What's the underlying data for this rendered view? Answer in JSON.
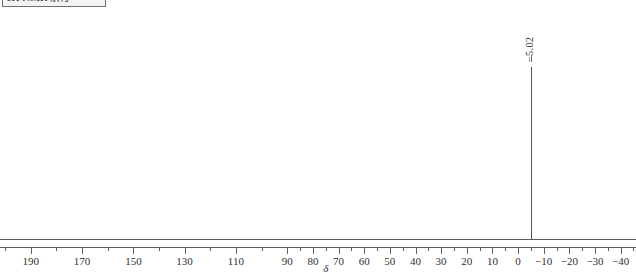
{
  "title_strip": {
    "text": "1H NMR 解序"
  },
  "chart_data": {
    "type": "line",
    "title": "",
    "subtitle": "",
    "xlabel": "δ",
    "ylabel": "",
    "grid": false,
    "legend": null,
    "xlim": [
      202,
      -46
    ],
    "x_axis_reversed": true,
    "ylim": [
      0,
      1
    ],
    "tick_labels": [
      {
        "value": 190,
        "label": "190"
      },
      {
        "value": 170,
        "label": "170"
      },
      {
        "value": 150,
        "label": "150"
      },
      {
        "value": 130,
        "label": "130"
      },
      {
        "value": 110,
        "label": "110"
      },
      {
        "value": 90,
        "label": "90"
      },
      {
        "value": 80,
        "label": "80"
      },
      {
        "value": 70,
        "label": "70"
      },
      {
        "value": 60,
        "label": "60"
      },
      {
        "value": 50,
        "label": "50"
      },
      {
        "value": 40,
        "label": "40"
      },
      {
        "value": 30,
        "label": "30"
      },
      {
        "value": 20,
        "label": "20"
      },
      {
        "value": 10,
        "label": "10"
      },
      {
        "value": 0,
        "label": "0"
      },
      {
        "value": -10,
        "label": "−10"
      },
      {
        "value": -20,
        "label": "−20"
      },
      {
        "value": -30,
        "label": "−30"
      },
      {
        "value": -40,
        "label": "−40"
      }
    ],
    "minor_ticks": [
      200,
      180,
      160,
      140,
      120,
      100,
      85,
      75,
      65,
      55,
      45,
      35,
      25,
      15,
      5,
      -5,
      -15,
      -25,
      -35,
      -45
    ],
    "peaks": [
      {
        "shift": -5.02,
        "label": "−5.02",
        "relative_height": 0.865
      }
    ],
    "baseline_intensity": 0.0,
    "annotations": []
  },
  "colors": {
    "trace": "#555555",
    "axis": "#5f5f5f",
    "text": "#2f2f2f",
    "background": "#ffffff"
  }
}
